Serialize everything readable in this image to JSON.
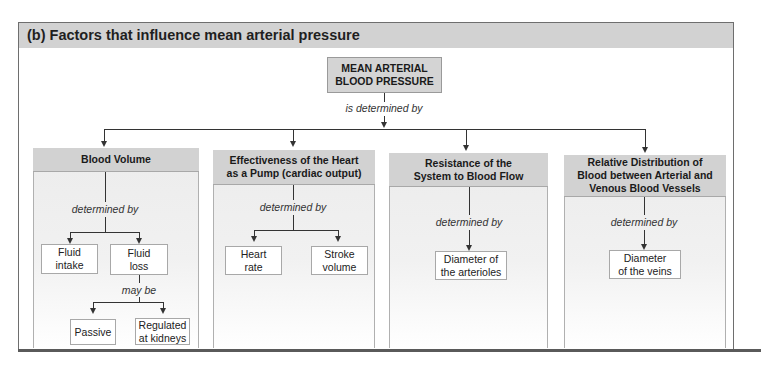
{
  "figure": {
    "title": "(b) Factors that influence mean arterial pressure",
    "root": {
      "line1": "MEAN ARTERIAL",
      "line2": "BLOOD PRESSURE"
    },
    "root_connector": "is determined by",
    "columns": [
      {
        "title_lines": [
          "Blood Volume"
        ],
        "connector": "determined by",
        "children": [
          {
            "lines": [
              "Fluid",
              "intake"
            ]
          },
          {
            "lines": [
              "Fluid",
              "loss"
            ]
          }
        ],
        "sub_connector": "may be",
        "sub_children": [
          {
            "lines": [
              "Passive"
            ]
          },
          {
            "lines": [
              "Regulated",
              "at kidneys"
            ]
          }
        ]
      },
      {
        "title_lines": [
          "Effectiveness of the Heart",
          "as a Pump (cardiac output)"
        ],
        "connector": "determined by",
        "children": [
          {
            "lines": [
              "Heart",
              "rate"
            ]
          },
          {
            "lines": [
              "Stroke",
              "volume"
            ]
          }
        ]
      },
      {
        "title_lines": [
          "Resistance of the",
          "System to Blood Flow"
        ],
        "connector": "determined by",
        "children": [
          {
            "lines": [
              "Diameter of",
              "the arterioles"
            ]
          }
        ]
      },
      {
        "title_lines": [
          "Relative Distribution of",
          "Blood between Arterial and",
          "Venous Blood Vessels"
        ],
        "connector": "determined by",
        "children": [
          {
            "lines": [
              "Diameter",
              "of the veins"
            ]
          }
        ]
      }
    ]
  }
}
